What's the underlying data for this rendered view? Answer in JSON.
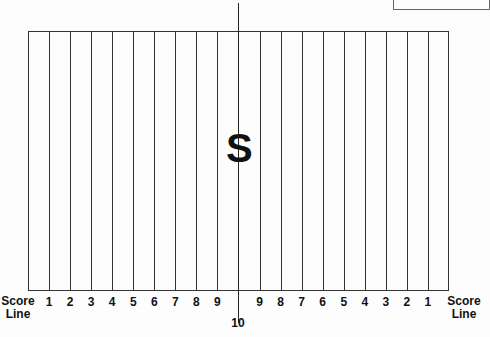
{
  "diagram": {
    "type": "playing-field",
    "center_mark": "S",
    "center_label": "10",
    "left_end_label": [
      "Score",
      "Line"
    ],
    "right_end_label": [
      "Score",
      "Line"
    ],
    "left_yard_labels": [
      "1",
      "2",
      "3",
      "4",
      "5",
      "6",
      "7",
      "8",
      "9"
    ],
    "right_yard_labels": [
      "9",
      "8",
      "7",
      "6",
      "5",
      "4",
      "3",
      "2",
      "1"
    ],
    "column_count": 20,
    "line_color": "#333333"
  }
}
